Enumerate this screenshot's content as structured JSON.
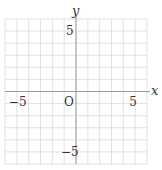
{
  "chart_data": {
    "type": "line",
    "title": "",
    "xlabel": "x",
    "ylabel": "y",
    "xlim": [
      -6,
      6
    ],
    "ylim": [
      -6,
      6
    ],
    "grid": true,
    "grid_step": 1,
    "x_ticks": [
      {
        "value": -5,
        "label": "−5"
      },
      {
        "value": 5,
        "label": "5"
      }
    ],
    "y_ticks": [
      {
        "value": 5,
        "label": "5"
      },
      {
        "value": -5,
        "label": "−5"
      }
    ],
    "origin_label": "O",
    "series": []
  },
  "colors": {
    "grid": "#d9d9d9",
    "axis": "#9a9a9a",
    "text": "#333333"
  }
}
